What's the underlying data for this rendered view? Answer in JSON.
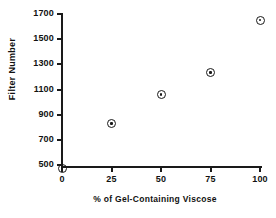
{
  "chart_data": {
    "type": "scatter",
    "title": "",
    "xlabel": "%  of Gel-Containing  Viscose",
    "ylabel": "Filter Number",
    "x": [
      0,
      25,
      50,
      75,
      100
    ],
    "values": [
      470,
      830,
      1060,
      1235,
      1650
    ],
    "series": [
      {
        "name": "Filter Number",
        "x": [
          0,
          25,
          50,
          75,
          100
        ],
        "values": [
          470,
          830,
          1060,
          1235,
          1650
        ]
      }
    ],
    "xlim": [
      0,
      100
    ],
    "ylim": [
      470,
      1700
    ],
    "xticks": [
      0,
      25,
      50,
      75,
      100
    ],
    "yticks": [
      500,
      700,
      900,
      1100,
      1300,
      1500,
      1700
    ],
    "xticklabels": [
      "0",
      "25",
      "50",
      "75",
      "100"
    ],
    "yticklabels": [
      "500",
      "700",
      "900",
      "1100",
      "1300",
      "1500",
      "1700"
    ],
    "grid": false,
    "legend": false,
    "marker": "circle-with-center-dot",
    "marker_color": "#1a1a1a",
    "background_color": "#ffffff"
  }
}
